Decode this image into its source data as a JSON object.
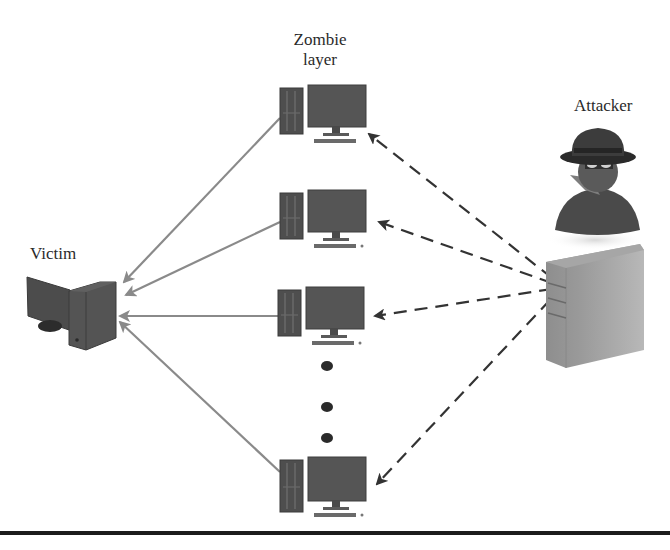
{
  "labels": {
    "zombie_layer_line1": "Zombie",
    "zombie_layer_line2": "layer",
    "attacker": "Attacker",
    "victim": "Victim"
  },
  "nodes": {
    "attacker": {
      "icon": "spy-icon",
      "server_icon": "server-icon"
    },
    "victim": {
      "icon": "computer-icon"
    },
    "zombies": [
      {
        "id": "zombie-1",
        "icon": "desktop-computer-icon"
      },
      {
        "id": "zombie-2",
        "icon": "desktop-computer-icon"
      },
      {
        "id": "zombie-3",
        "icon": "desktop-computer-icon"
      },
      {
        "id": "zombie-n",
        "icon": "desktop-computer-icon"
      }
    ],
    "ellipsis_dots": 3
  },
  "edges": {
    "attacker_to_zombies": {
      "style": "dashed",
      "color": "#333333",
      "count": 4
    },
    "zombies_to_victim": {
      "style": "solid",
      "color": "#8a8a8a",
      "count": 4
    }
  },
  "colors": {
    "dark_icon": "#4a4a4a",
    "solid_arrow": "#8a8a8a",
    "dashed_arrow": "#333333",
    "rule": "#1c1c1c"
  }
}
